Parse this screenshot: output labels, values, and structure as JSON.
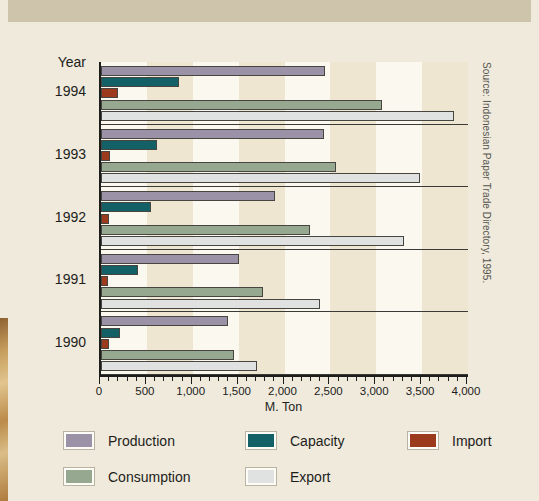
{
  "title_band": {
    "title": ""
  },
  "source_note": "Source: Indonesian Paper Trade Directory, 1995.",
  "axis": {
    "y_header": "Year",
    "x_title": "M. Ton",
    "x_ticks": [
      "0",
      "500",
      "1,000",
      "1,500",
      "2,000",
      "2,500",
      "3,000",
      "3,500",
      "4,000"
    ]
  },
  "legend": {
    "items": [
      {
        "label": "Production",
        "color": "#9b92a8"
      },
      {
        "label": "Capacity",
        "color": "#136066"
      },
      {
        "label": "Import",
        "color": "#9c3a1e"
      },
      {
        "label": "Consumption",
        "color": "#97a890"
      },
      {
        "label": "Export",
        "color": "#dfe2e0"
      }
    ]
  },
  "chart_data": {
    "type": "bar",
    "orientation": "horizontal",
    "title": "",
    "xlabel": "M. Ton",
    "ylabel": "Year",
    "xlim": [
      0,
      4000
    ],
    "xticks": [
      0,
      500,
      1000,
      1500,
      2000,
      2500,
      3000,
      3500,
      4000
    ],
    "grid": false,
    "legend_position": "bottom",
    "categories": [
      "1994",
      "1993",
      "1992",
      "1991",
      "1990"
    ],
    "series": [
      {
        "name": "Production",
        "color": "#9b92a8",
        "values": [
          2440,
          2430,
          1895,
          1500,
          1385
        ]
      },
      {
        "name": "Capacity",
        "color": "#136066",
        "values": [
          850,
          610,
          545,
          400,
          210
        ]
      },
      {
        "name": "Import",
        "color": "#9c3a1e",
        "values": [
          185,
          100,
          87,
          77,
          85
        ]
      },
      {
        "name": "Consumption",
        "color": "#97a890",
        "values": [
          3060,
          2560,
          2275,
          1765,
          1450
        ]
      },
      {
        "name": "Export",
        "color": "#dfe2e0",
        "values": [
          3845,
          3475,
          3300,
          2385,
          1700
        ]
      }
    ],
    "source": "Indonesian Paper Trade Directory, 1995."
  }
}
